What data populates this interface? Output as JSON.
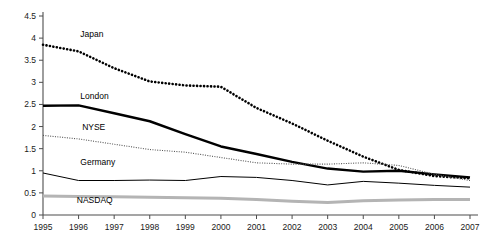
{
  "chart_data": {
    "type": "line",
    "title": "",
    "xlabel": "",
    "ylabel": "",
    "x": [
      1995,
      1996,
      1997,
      1998,
      1999,
      2000,
      2001,
      2002,
      2003,
      2004,
      2005,
      2006,
      2007
    ],
    "categories": [
      "1995",
      "1996",
      "1997",
      "1998",
      "1999",
      "2000",
      "2001",
      "2002",
      "2003",
      "2004",
      "2005",
      "2006",
      "2007"
    ],
    "xlim": [
      1995,
      2007
    ],
    "ylim": [
      0,
      4.5
    ],
    "ytick_labels": [
      "0",
      "0.5",
      "1",
      "1.5",
      "2",
      "2.5",
      "3",
      "3.5",
      "4",
      "4.5"
    ],
    "ytick_values": [
      0,
      0.5,
      1,
      1.5,
      2,
      2.5,
      3,
      3.5,
      4,
      4.5
    ],
    "grid": false,
    "legend": "inline-labels",
    "series": [
      {
        "name": "Japan",
        "style": "dotted-thick",
        "color": "#000000",
        "label_x": 1996.05,
        "label_y": 4.02,
        "values": [
          3.85,
          3.7,
          3.32,
          3.02,
          2.93,
          2.9,
          2.42,
          2.07,
          1.68,
          1.32,
          1.02,
          0.88,
          0.83
        ]
      },
      {
        "name": "London",
        "style": "solid-thick",
        "color": "#000000",
        "label_x": 1996.05,
        "label_y": 2.62,
        "values": [
          2.47,
          2.48,
          2.3,
          2.12,
          1.83,
          1.55,
          1.38,
          1.2,
          1.05,
          0.98,
          1.0,
          0.92,
          0.85
        ]
      },
      {
        "name": "NYSE",
        "style": "dotted-thin",
        "color": "#555555",
        "label_x": 1996.1,
        "label_y": 1.93,
        "values": [
          1.8,
          1.72,
          1.6,
          1.48,
          1.42,
          1.3,
          1.18,
          1.15,
          1.15,
          1.18,
          1.12,
          0.92,
          0.78
        ]
      },
      {
        "name": "Germany",
        "style": "solid-thin",
        "color": "#000000",
        "label_x": 1996.05,
        "label_y": 1.12,
        "values": [
          0.95,
          0.78,
          0.78,
          0.79,
          0.78,
          0.87,
          0.85,
          0.78,
          0.68,
          0.76,
          0.72,
          0.67,
          0.63
        ]
      },
      {
        "name": "NASDAQ",
        "style": "solid-gray-thick",
        "color": "#b4b4b4",
        "label_x": 1995.95,
        "label_y": 0.27,
        "values": [
          0.43,
          0.42,
          0.41,
          0.4,
          0.39,
          0.38,
          0.35,
          0.31,
          0.28,
          0.32,
          0.34,
          0.35,
          0.35
        ]
      }
    ]
  },
  "caption": {
    "text": ""
  }
}
